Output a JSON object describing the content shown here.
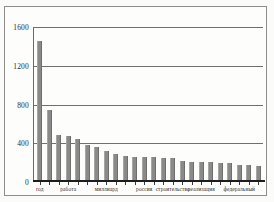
{
  "chart_data": {
    "type": "bar",
    "title": "",
    "subtitle": "",
    "xlabel": "",
    "ylabel": "",
    "ylim": [
      0,
      1600
    ],
    "yticks": [
      0,
      400,
      800,
      1200,
      1600
    ],
    "ytick_labels": [
      "0",
      "400",
      "800",
      "1200",
      "1600"
    ],
    "grid": true,
    "legend": false,
    "bar_color": "#8a8a8a",
    "axis_color": "#1d1d1d",
    "gridline_color": "#6f6f6f",
    "categories": [
      "год",
      "",
      "",
      "работа",
      "",
      "",
      "",
      "миллиард",
      "",
      "",
      "",
      "россия",
      "",
      "",
      "строительство",
      "",
      "реализация",
      "",
      "",
      "",
      "федеральный",
      "",
      "",
      ""
    ],
    "values": [
      1450,
      735,
      480,
      460,
      435,
      370,
      355,
      310,
      280,
      255,
      250,
      245,
      245,
      240,
      235,
      210,
      200,
      200,
      195,
      190,
      185,
      170,
      165,
      160
    ],
    "visible_xtick_labels": [
      {
        "index": 0,
        "text": "год"
      },
      {
        "index": 3,
        "text": "работа"
      },
      {
        "index": 7,
        "text": "миллиард"
      },
      {
        "index": 11,
        "text": "россия"
      },
      {
        "index": 14,
        "text": "строительство"
      },
      {
        "index": 17,
        "text": "реализация"
      },
      {
        "index": 21,
        "text": "федеральный"
      }
    ]
  }
}
